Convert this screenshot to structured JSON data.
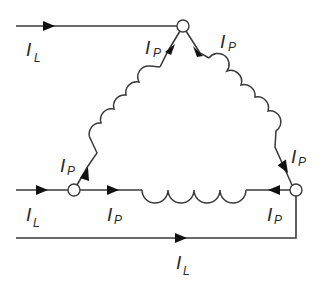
{
  "diagram": {
    "nodes": [
      {
        "id": "top",
        "x": 183,
        "y": 26
      },
      {
        "id": "left",
        "x": 74,
        "y": 190
      },
      {
        "id": "right",
        "x": 296,
        "y": 190
      }
    ],
    "labels": {
      "top_line": {
        "main": "I",
        "sub": "L"
      },
      "top_left_phase": {
        "main": "I",
        "sub": "P"
      },
      "top_right_phase": {
        "main": "I",
        "sub": "P"
      },
      "left_phase_up": {
        "main": "I",
        "sub": "P"
      },
      "left_line": {
        "main": "I",
        "sub": "L"
      },
      "left_phase_right": {
        "main": "I",
        "sub": "P"
      },
      "right_phase_up": {
        "main": "I",
        "sub": "P"
      },
      "right_phase_left": {
        "main": "I",
        "sub": "P"
      },
      "bottom_line": {
        "main": "I",
        "sub": "L"
      }
    },
    "windings": [
      {
        "name": "left-winding",
        "turns": 5
      },
      {
        "name": "right-winding",
        "turns": 5
      },
      {
        "name": "bottom-winding",
        "turns": 4
      }
    ],
    "colors": {
      "stroke": "#3a3a3a",
      "arrow": "#111111",
      "background": "#ffffff"
    }
  }
}
